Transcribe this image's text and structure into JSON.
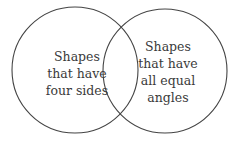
{
  "diagram": {
    "type": "venn",
    "sets": [
      {
        "name": "left",
        "label_lines": [
          "Shapes",
          "that have",
          "four sides"
        ]
      },
      {
        "name": "right",
        "label_lines": [
          "Shapes",
          "that have",
          "all equal",
          "angles"
        ]
      }
    ],
    "intersection_label": "",
    "colors": {
      "stroke": "#3a3a3a",
      "text": "#3a3a3a",
      "background": "#ffffff"
    }
  }
}
